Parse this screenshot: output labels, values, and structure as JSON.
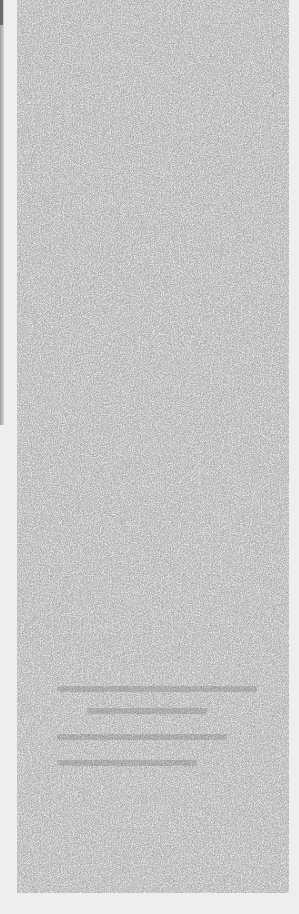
{
  "page": {
    "background_color": "#eeeeee",
    "state": "obscured"
  },
  "noise_panel": {
    "description": "static noise overlay covering panel content",
    "base_color": "#6e6e6e",
    "highlight_color": "#e6e6e6",
    "obscured_text_lines": 4
  },
  "left_strip": {
    "color": "#8a8a8a"
  }
}
